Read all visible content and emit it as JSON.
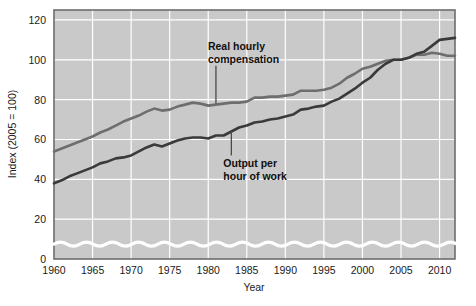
{
  "chart_data": {
    "type": "line",
    "title": "",
    "xlabel": "Year",
    "ylabel": "Index (2005 = 100)",
    "xlim": [
      1960,
      2012
    ],
    "ylim": [
      0,
      125
    ],
    "xticks": [
      1960,
      1965,
      1970,
      1975,
      1980,
      1985,
      1990,
      1995,
      2000,
      2005,
      2010
    ],
    "yticks": [
      0,
      20,
      40,
      60,
      80,
      100,
      120
    ],
    "grid": true,
    "grid_color": "#ffffff",
    "plot_background": "#c9c9c9",
    "axis_break": true,
    "legend": "annotations",
    "x": [
      1960,
      1961,
      1962,
      1963,
      1964,
      1965,
      1966,
      1967,
      1968,
      1969,
      1970,
      1971,
      1972,
      1973,
      1974,
      1975,
      1976,
      1977,
      1978,
      1979,
      1980,
      1981,
      1982,
      1983,
      1984,
      1985,
      1986,
      1987,
      1988,
      1989,
      1990,
      1991,
      1992,
      1993,
      1994,
      1995,
      1996,
      1997,
      1998,
      1999,
      2000,
      2001,
      2002,
      2003,
      2004,
      2005,
      2006,
      2007,
      2008,
      2009,
      2010,
      2011,
      2012
    ],
    "series": [
      {
        "name": "Real hourly compensation",
        "color": "#6e6e6e",
        "label_text": "Real hourly compensation",
        "values": [
          54,
          55.5,
          57,
          58.5,
          60,
          61.5,
          63.5,
          65,
          67,
          69,
          70.5,
          72,
          74,
          75.5,
          74.5,
          75,
          76.5,
          77.5,
          78.5,
          78,
          77,
          77.5,
          78,
          78.5,
          78.5,
          79,
          81,
          81,
          81.5,
          81.5,
          82,
          82.5,
          84.5,
          84.5,
          84.5,
          85,
          86,
          88,
          91,
          93,
          95.5,
          96.5,
          98,
          99.5,
          100,
          100,
          101,
          102.5,
          102.5,
          103.5,
          103,
          102,
          102
        ]
      },
      {
        "name": "Output per hour of work",
        "color": "#3a3a3a",
        "label_text": "Output per hour of work",
        "values": [
          38,
          39.5,
          41.5,
          43,
          44.5,
          46,
          48,
          49,
          50.5,
          51,
          52,
          54,
          56,
          57.5,
          56.5,
          58,
          59.5,
          60.5,
          61,
          61,
          60.5,
          62,
          62,
          64,
          66,
          67,
          68.5,
          69,
          70,
          70.5,
          71.5,
          72.5,
          75,
          75.5,
          76.5,
          77,
          79,
          80.5,
          83,
          85.5,
          88.5,
          91,
          95,
          98,
          100,
          100,
          101,
          103,
          104,
          107,
          110,
          110.5,
          111
        ]
      }
    ],
    "annotations": [
      {
        "name": "real-hourly-compensation",
        "text_line1": "Real hourly",
        "text_line2": "compensation",
        "leader_from_year": 1981,
        "leader_from_value": 97,
        "leader_to_value": 78
      },
      {
        "name": "output-per-hour-of-work",
        "text_line1": "Output per",
        "text_line2": "hour of work",
        "leader_from_year": 1983,
        "leader_from_value": 52,
        "leader_to_value": 64
      }
    ]
  },
  "source_note": ""
}
